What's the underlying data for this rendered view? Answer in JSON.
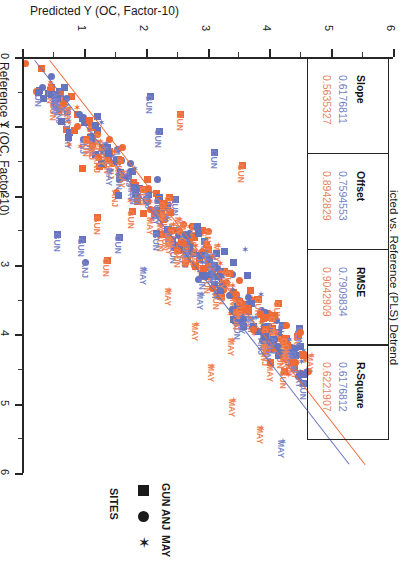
{
  "chart_data": {
    "type": "scatter",
    "title": "icted vs. Reference (PLS) Detrend",
    "xlabel": "Predicted Y (OC, Factor-10)",
    "ylabel": "Reference Y (OC, Factor-10)",
    "xlim": [
      0,
      6
    ],
    "ylim": [
      0,
      6
    ],
    "xticks": [
      "0",
      "1",
      "2",
      "3",
      "4",
      "5",
      "6"
    ],
    "yticks": [
      "0",
      "1",
      "2",
      "3",
      "4",
      "5",
      "6"
    ],
    "grid": false,
    "orientation": "rotated-90",
    "series": [
      {
        "name": "Calibration",
        "color": "#6673bd",
        "label_color": "#7a86c9",
        "slope": "0.6176811",
        "offset": "0.7594553",
        "rmse": "0.7909834",
        "r_square": "0.6176812"
      },
      {
        "name": "Validation",
        "color": "#ee6a36",
        "label_color": "#ef8356",
        "slope": "0.5635327",
        "offset": "0.8942829",
        "rmse": "0.9042909",
        "r_square": "0.6221907"
      }
    ],
    "point_labels": [
      "GUN",
      "ANJ",
      "MAY"
    ],
    "annotations": [
      "GUN",
      "ANJ",
      "MAY"
    ]
  },
  "stats_table": {
    "columns": [
      {
        "header": "Slope",
        "blue": "0.6176811",
        "orange": "0.5635327"
      },
      {
        "header": "Offset",
        "blue": "0.7594553",
        "orange": "0.8942829"
      },
      {
        "header": "RMSE",
        "blue": "0.7909834",
        "orange": "0.9042909"
      },
      {
        "header": "R-Square",
        "blue": "0.6176812",
        "orange": "0.6221907"
      }
    ]
  },
  "legend": {
    "title": "SITES",
    "entries": [
      {
        "label": "GUN",
        "marker": "square-marker"
      },
      {
        "label": "ANJ",
        "marker": "circle-marker"
      },
      {
        "label": "MAY",
        "marker": "star-marker"
      }
    ]
  },
  "colors": {
    "series_blue": "#6673bd",
    "series_orange": "#ee6a36",
    "axis": "#262626",
    "background": "#ffffff"
  }
}
